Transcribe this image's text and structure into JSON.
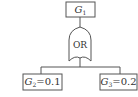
{
  "diagram": {
    "type": "fault-tree",
    "top_event": {
      "symbol": "G",
      "subscript": "1"
    },
    "gate": {
      "label": "OR"
    },
    "children": [
      {
        "symbol": "G",
        "subscript": "2",
        "value": "=0.1"
      },
      {
        "symbol": "G",
        "subscript": "3",
        "value": "=0.2"
      }
    ],
    "colors": {
      "stroke": "#555555",
      "text": "#333333",
      "background": "#ffffff"
    }
  }
}
